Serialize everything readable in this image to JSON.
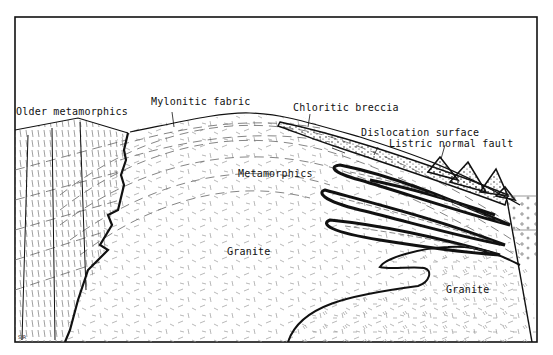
{
  "diagram": {
    "type": "geologic-cross-section",
    "labels": {
      "older_metamorphics": "Older metamorphics",
      "mylonitic_fabric": "Mylonitic fabric",
      "chloritic_breccia": "Chloritic breccia",
      "dislocation_surface": "Dislocation surface",
      "listric_normal_fault": "Listric normal fault",
      "metamorphics": "Metamorphics",
      "granite_center": "Granite",
      "granite_right": "Granite"
    },
    "initials": "SJR",
    "colors": {
      "ink": "#111111",
      "paper": "#ffffff",
      "hatch": "#888888"
    }
  }
}
